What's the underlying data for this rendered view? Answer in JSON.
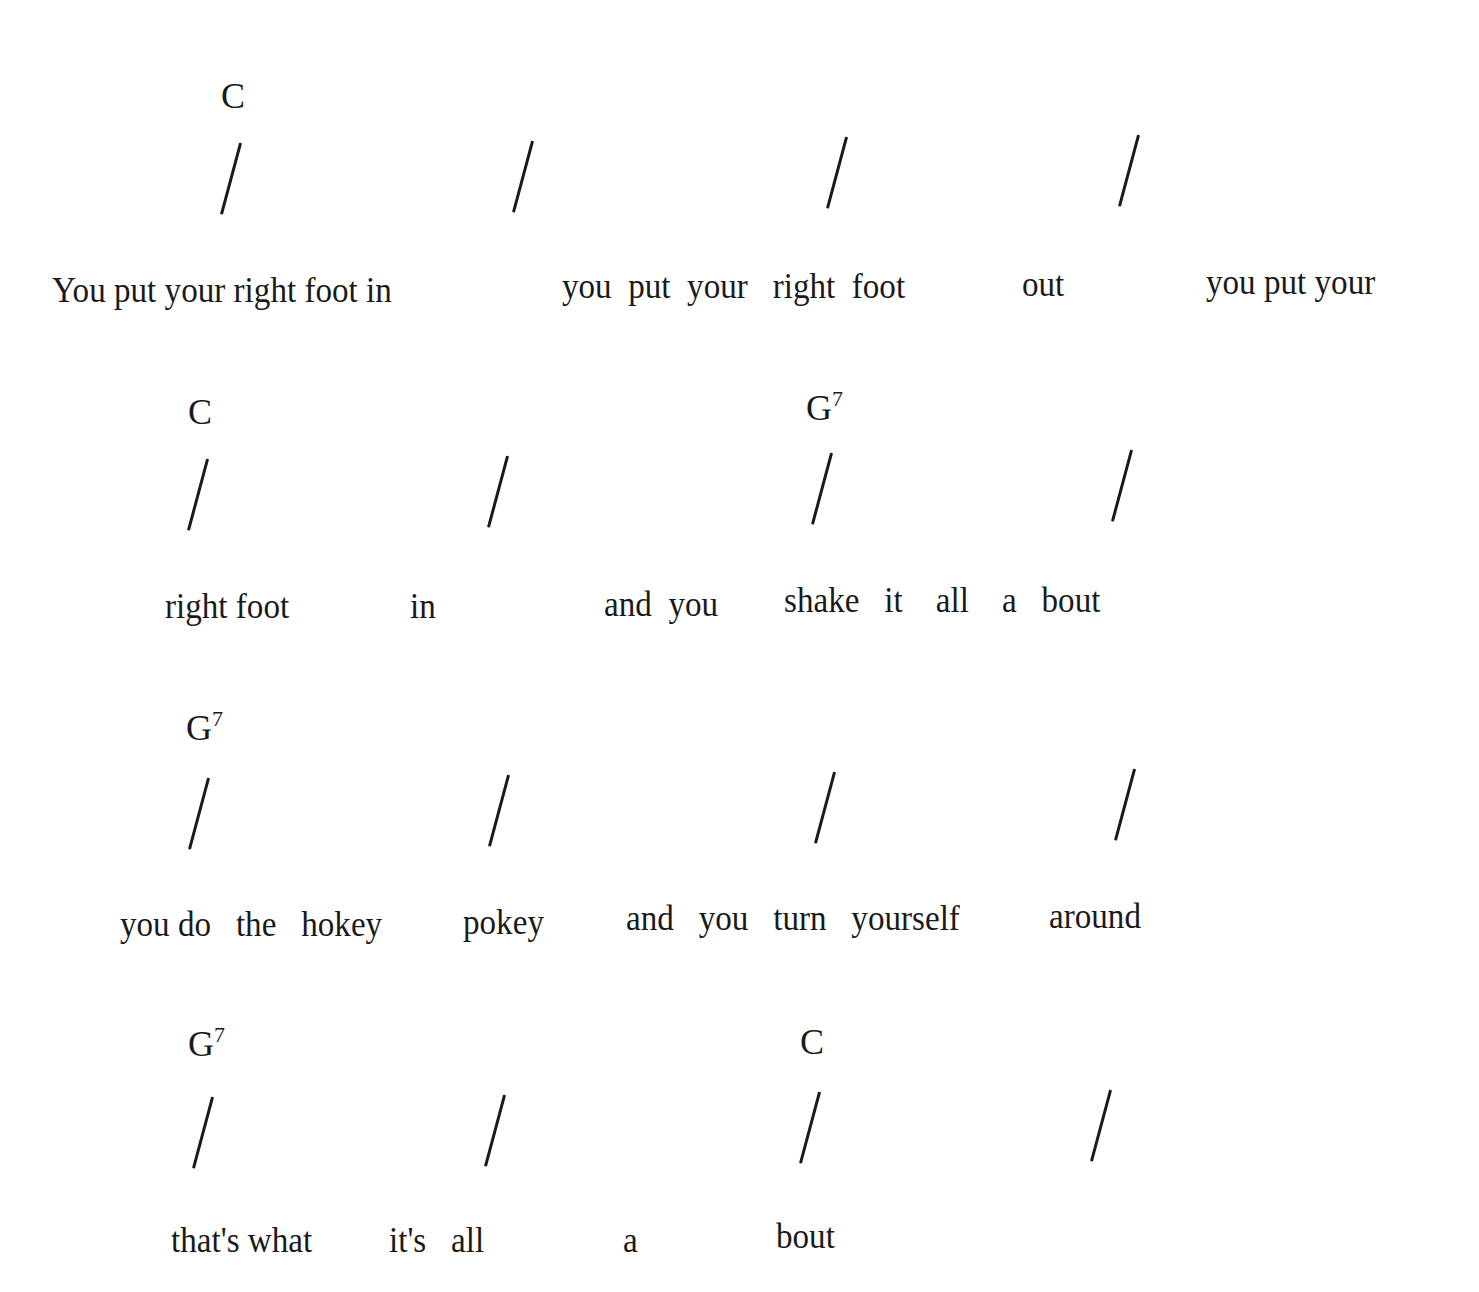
{
  "song_sheet": {
    "lines": [
      {
        "chords": [
          {
            "root": "C",
            "ext": "",
            "x": 221,
            "y": 78
          }
        ],
        "slashes": [
          {
            "x": 220,
            "y": 140
          },
          {
            "x": 512,
            "y": 138
          },
          {
            "x": 826,
            "y": 134
          },
          {
            "x": 1118,
            "y": 132
          }
        ],
        "lyrics": [
          {
            "text": "You put your right foot in",
            "x": 52,
            "y": 272
          },
          {
            "text": "you  put  your   right  foot",
            "x": 562,
            "y": 268
          },
          {
            "text": "out",
            "x": 1022,
            "y": 266
          },
          {
            "text": "you put your",
            "x": 1206,
            "y": 264
          }
        ]
      },
      {
        "chords": [
          {
            "root": "C",
            "ext": "",
            "x": 188,
            "y": 394
          },
          {
            "root": "G",
            "ext": "7",
            "x": 806,
            "y": 390
          }
        ],
        "slashes": [
          {
            "x": 187,
            "y": 456
          },
          {
            "x": 487,
            "y": 453
          },
          {
            "x": 811,
            "y": 450
          },
          {
            "x": 1111,
            "y": 447
          }
        ],
        "lyrics": [
          {
            "text": "right foot",
            "x": 165,
            "y": 588
          },
          {
            "text": "in",
            "x": 410,
            "y": 588
          },
          {
            "text": "and  you",
            "x": 604,
            "y": 586
          },
          {
            "text": "shake   it    all    a   bout",
            "x": 784,
            "y": 582
          }
        ]
      },
      {
        "chords": [
          {
            "root": "G",
            "ext": "7",
            "x": 186,
            "y": 710
          }
        ],
        "slashes": [
          {
            "x": 188,
            "y": 775
          },
          {
            "x": 488,
            "y": 772
          },
          {
            "x": 814,
            "y": 769
          },
          {
            "x": 1114,
            "y": 766
          }
        ],
        "lyrics": [
          {
            "text": "you do   the   hokey",
            "x": 120,
            "y": 906
          },
          {
            "text": "pokey",
            "x": 463,
            "y": 904
          },
          {
            "text": "and   you   turn   yourself",
            "x": 626,
            "y": 900
          },
          {
            "text": "around",
            "x": 1049,
            "y": 898
          }
        ]
      },
      {
        "chords": [
          {
            "root": "G",
            "ext": "7",
            "x": 188,
            "y": 1026
          },
          {
            "root": "C",
            "ext": "",
            "x": 800,
            "y": 1024
          }
        ],
        "slashes": [
          {
            "x": 192,
            "y": 1094
          },
          {
            "x": 484,
            "y": 1092
          },
          {
            "x": 799,
            "y": 1089
          },
          {
            "x": 1090,
            "y": 1087
          }
        ],
        "lyrics": [
          {
            "text": "that's what",
            "x": 171,
            "y": 1222
          },
          {
            "text": "it's   all",
            "x": 389,
            "y": 1222
          },
          {
            "text": "a",
            "x": 623,
            "y": 1222
          },
          {
            "text": "bout",
            "x": 776,
            "y": 1218
          }
        ]
      }
    ]
  }
}
